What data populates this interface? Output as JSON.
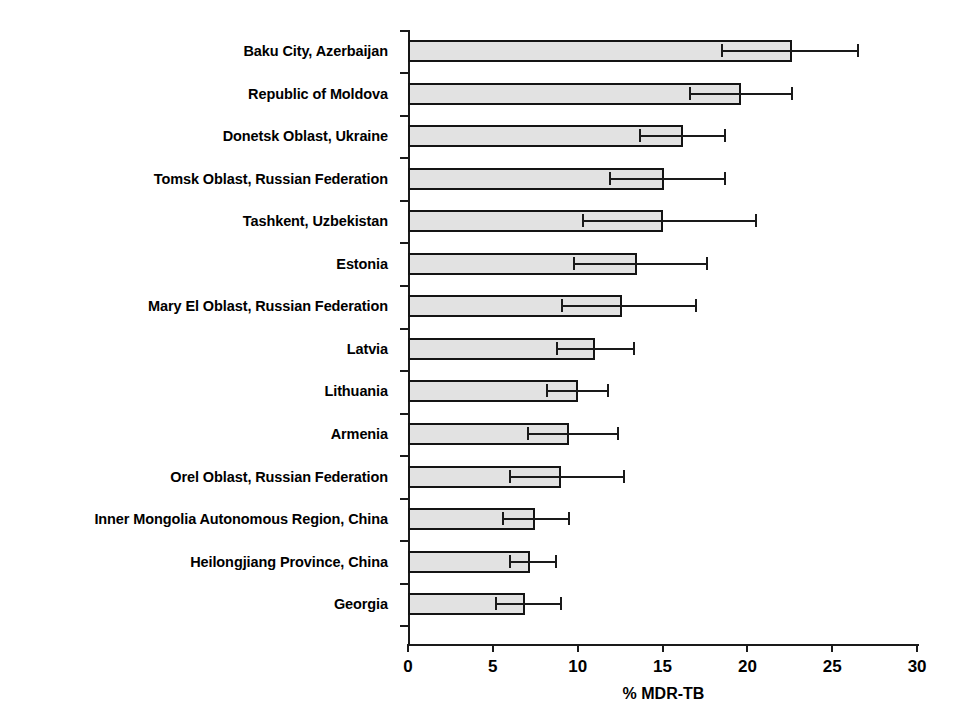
{
  "chart": {
    "type": "bar",
    "title": "",
    "xlabel": "% MDR-TB",
    "ylabel": "",
    "orientation": "horizontal",
    "grid": false,
    "legend": "none"
  },
  "axis": {
    "x_ticks": [
      "0",
      "5",
      "10",
      "15",
      "20",
      "25",
      "30"
    ],
    "x_min": 0,
    "x_max": 30,
    "title": "% MDR-TB"
  },
  "chart_data": {
    "type": "bar",
    "orientation": "horizontal",
    "title": "",
    "xlabel": "% MDR-TB",
    "ylabel": "",
    "xlim": [
      0,
      30
    ],
    "grid": false,
    "legend": "none",
    "error_bars": "95% confidence interval",
    "categories": [
      "Baku City, Azerbaijan",
      "Republic of Moldova",
      "Donetsk Oblast, Ukraine",
      "Tomsk Oblast, Russian Federation",
      "Tashkent, Uzbekistan",
      "Estonia",
      "Mary El Oblast, Russian Federation",
      "Latvia",
      "Lithuania",
      "Armenia",
      "Orel Oblast, Russian Federation",
      "Inner Mongolia Autonomous Region, China",
      "Heilongjiang Province, China",
      "Georgia"
    ],
    "values": [
      22.6,
      19.6,
      16.2,
      15.1,
      15.0,
      13.5,
      12.6,
      11.0,
      10.0,
      9.5,
      9.0,
      7.5,
      7.2,
      6.9
    ],
    "ci_low": [
      18.5,
      16.6,
      13.7,
      11.9,
      10.3,
      9.8,
      9.1,
      8.8,
      8.2,
      7.1,
      6.0,
      5.6,
      6.0,
      5.2
    ],
    "ci_high": [
      26.5,
      22.6,
      18.7,
      18.7,
      20.5,
      17.6,
      17.0,
      13.3,
      11.8,
      12.4,
      12.7,
      9.5,
      8.7,
      9.0
    ]
  },
  "colors": {
    "bar_fill": "#e2e2e2",
    "bar_stroke": "#141414",
    "axis": "#1a1a1a",
    "background": "#ffffff"
  }
}
